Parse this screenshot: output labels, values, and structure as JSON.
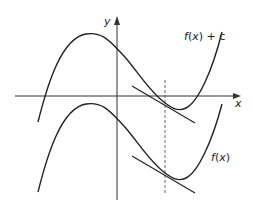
{
  "diagram": {
    "axes": {
      "x_label": "x",
      "y_label": "y"
    },
    "curves": [
      {
        "id": "shifted",
        "label": "f(x) + c",
        "label_parts": {
          "f": "f",
          "open": "(",
          "var": "x",
          "close": ")",
          "rest": " + c"
        }
      },
      {
        "id": "original",
        "label": "f(x)",
        "label_parts": {
          "f": "f",
          "open": "(",
          "var": "x",
          "close": ")"
        }
      }
    ],
    "annotations": {
      "tangent_lines": 2,
      "dashed_vertical_line": "common x-value where tangents touch both curves"
    }
  }
}
